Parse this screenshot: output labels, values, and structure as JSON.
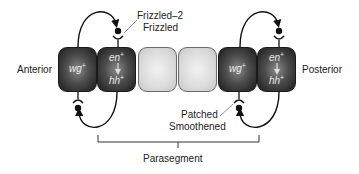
{
  "diagram": {
    "type": "segment-polarity-signaling",
    "orientation": {
      "left_label": "Anterior",
      "right_label": "Posterior"
    },
    "cells": [
      {
        "id": "cell-1",
        "shade": "dark",
        "genes": [
          "wg",
          "+"
        ]
      },
      {
        "id": "cell-2",
        "shade": "dark",
        "genes_top": [
          "en",
          "+"
        ],
        "genes_bottom": [
          "hh",
          "+"
        ]
      },
      {
        "id": "cell-3",
        "shade": "pale"
      },
      {
        "id": "cell-4",
        "shade": "pale"
      },
      {
        "id": "cell-5",
        "shade": "dark",
        "genes": [
          "wg",
          "+"
        ]
      },
      {
        "id": "cell-6",
        "shade": "dark",
        "genes_top": [
          "en",
          "+"
        ],
        "genes_bottom": [
          "hh",
          "+"
        ]
      }
    ],
    "receptor_labels": {
      "wingless_receptors_line1": "Frizzled–2",
      "wingless_receptors_line2": "Frizzled",
      "hedgehog_receptors_line1": "Patched",
      "hedgehog_receptors_line2": "Smoothened"
    },
    "bracket_label": "Parasegment",
    "text": {
      "wg": "wg",
      "en": "en",
      "hh": "hh",
      "plus": "+"
    },
    "colors": {
      "dark_cell": "#3a3a3a",
      "pale_cell": "#dcdcdc",
      "line": "#111111",
      "background": "#ffffff"
    }
  }
}
